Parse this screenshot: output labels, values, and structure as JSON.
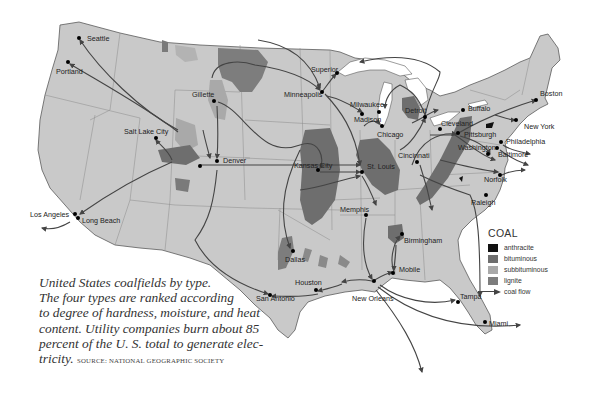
{
  "map": {
    "title": "United States coalfields by type",
    "land_color": "#c9c9c9",
    "border_color": "#8a8a8a",
    "coast_color": "#555555"
  },
  "cities": [
    {
      "name": "Seattle",
      "x": 79,
      "y": 38,
      "lx": 87,
      "ly": 41
    },
    {
      "name": "Portland",
      "x": 68,
      "y": 62,
      "lx": 56,
      "ly": 74
    },
    {
      "name": "Gillette",
      "x": 214,
      "y": 101,
      "lx": 192,
      "ly": 97
    },
    {
      "name": "Salt Lake City",
      "x": 156,
      "y": 138,
      "lx": 124,
      "ly": 134
    },
    {
      "name": "Denver",
      "x": 217,
      "y": 161,
      "lx": 223,
      "ly": 163
    },
    {
      "name": "Los Angeles",
      "x": 75,
      "y": 214,
      "lx": 30,
      "ly": 217
    },
    {
      "name": "Long Beach",
      "x": 78,
      "y": 218,
      "lx": 82,
      "ly": 223
    },
    {
      "name": "Superior",
      "x": 337,
      "y": 73,
      "lx": 311,
      "ly": 72
    },
    {
      "name": "Minneapolis",
      "x": 322,
      "y": 92,
      "lx": 284,
      "ly": 97
    },
    {
      "name": "Milwaukee",
      "x": 379,
      "y": 112,
      "lx": 350,
      "ly": 107
    },
    {
      "name": "Madison",
      "x": 362,
      "y": 114,
      "lx": 354,
      "ly": 122
    },
    {
      "name": "Chicago",
      "x": 382,
      "y": 126,
      "lx": 377,
      "ly": 137
    },
    {
      "name": "Detroit",
      "x": 425,
      "y": 117,
      "lx": 405,
      "ly": 113
    },
    {
      "name": "Buffalo",
      "x": 463,
      "y": 110,
      "lx": 468,
      "ly": 111
    },
    {
      "name": "Cleveland",
      "x": 440,
      "y": 129,
      "lx": 441,
      "ly": 126
    },
    {
      "name": "Pittsburgh",
      "x": 458,
      "y": 133,
      "lx": 464,
      "ly": 137
    },
    {
      "name": "Boston",
      "x": 536,
      "y": 100,
      "lx": 540,
      "ly": 96
    },
    {
      "name": "New York",
      "x": 516,
      "y": 120,
      "lx": 524,
      "ly": 129
    },
    {
      "name": "Philadelphia",
      "x": 501,
      "y": 142,
      "lx": 506,
      "ly": 144
    },
    {
      "name": "Washington",
      "x": 497,
      "y": 148,
      "lx": 458,
      "ly": 150
    },
    {
      "name": "Baltimore",
      "x": 488,
      "y": 154,
      "lx": 498,
      "ly": 157
    },
    {
      "name": "Norfolk",
      "x": 500,
      "y": 175,
      "lx": 484,
      "ly": 182
    },
    {
      "name": "Raleigh",
      "x": 486,
      "y": 195,
      "lx": 471,
      "ly": 205
    },
    {
      "name": "Cincinnati",
      "x": 417,
      "y": 162,
      "lx": 398,
      "ly": 158
    },
    {
      "name": "Kansas City",
      "x": 318,
      "y": 170,
      "lx": 294,
      "ly": 168
    },
    {
      "name": "St. Louis",
      "x": 362,
      "y": 172,
      "lx": 367,
      "ly": 169
    },
    {
      "name": "Memphis",
      "x": 366,
      "y": 215,
      "lx": 340,
      "ly": 212
    },
    {
      "name": "Birmingham",
      "x": 402,
      "y": 234,
      "lx": 404,
      "ly": 243
    },
    {
      "name": "Dallas",
      "x": 293,
      "y": 251,
      "lx": 285,
      "ly": 262
    },
    {
      "name": "Mobile",
      "x": 393,
      "y": 273,
      "lx": 399,
      "ly": 272
    },
    {
      "name": "New Orleans",
      "x": 374,
      "y": 281,
      "lx": 352,
      "ly": 301
    },
    {
      "name": "Houston",
      "x": 316,
      "y": 290,
      "lx": 295,
      "ly": 285
    },
    {
      "name": "San Antonio",
      "x": 270,
      "y": 295,
      "lx": 256,
      "ly": 301
    },
    {
      "name": "Tampa",
      "x": 458,
      "y": 302,
      "lx": 460,
      "ly": 299
    },
    {
      "name": "Miami",
      "x": 485,
      "y": 322,
      "lx": 489,
      "ly": 326
    }
  ],
  "caption": {
    "lines": [
      "United States coalfields by type.",
      "The four types are ranked according",
      "to degree of hardness, moisture, and heat",
      "content. Utility companies burn about 85",
      "percent of the  U. S. total to generate elec-"
    ],
    "last_line": "tricity.",
    "source": "SOURCE: NATIONAL GEOGRAPHIC SOCIETY"
  },
  "legend": {
    "title": "COAL",
    "items": [
      {
        "label": "anthracite",
        "color": "#111111"
      },
      {
        "label": "bituminous",
        "color": "#6e6e6e"
      },
      {
        "label": "subbituminous",
        "color": "#a9a9a9"
      },
      {
        "label": "lignite",
        "color": "#7d7d7d"
      }
    ],
    "flow_label": "coal flow"
  }
}
